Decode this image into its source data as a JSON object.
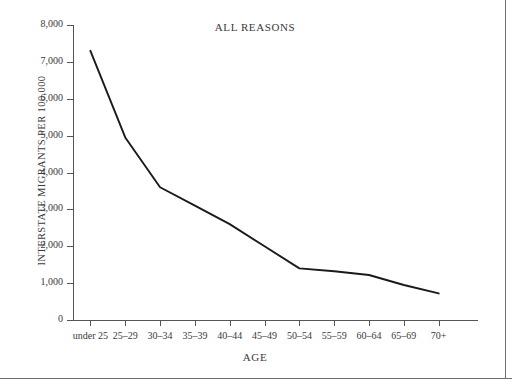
{
  "figure": {
    "title": "ALL REASONS",
    "y_axis_title": "INTERSTATE MIGRANTS PER 100,000",
    "x_axis_title": "AGE"
  },
  "chart_data": {
    "type": "line",
    "title": "ALL REASONS",
    "xlabel": "AGE",
    "ylabel": "INTERSTATE MIGRANTS PER 100,000",
    "categories": [
      "under 25",
      "25–29",
      "30–34",
      "35–39",
      "40–44",
      "45–49",
      "50–54",
      "55–59",
      "60–64",
      "65–69",
      "70+"
    ],
    "values": [
      7300,
      4950,
      3600,
      3100,
      2600,
      2000,
      1400,
      1320,
      1220,
      950,
      720
    ],
    "ylim": [
      0,
      8000
    ],
    "yticks": [
      0,
      1000,
      2000,
      3000,
      4000,
      5000,
      6000,
      7000,
      8000
    ],
    "ytick_labels": [
      "0",
      "1,000",
      "2,000",
      "3,000",
      "4,000",
      "5,000",
      "6,000",
      "7,000",
      "8,000"
    ],
    "grid": false,
    "legend": "none",
    "line_color": "#1a1a1a",
    "background_color": "#ffffff"
  }
}
